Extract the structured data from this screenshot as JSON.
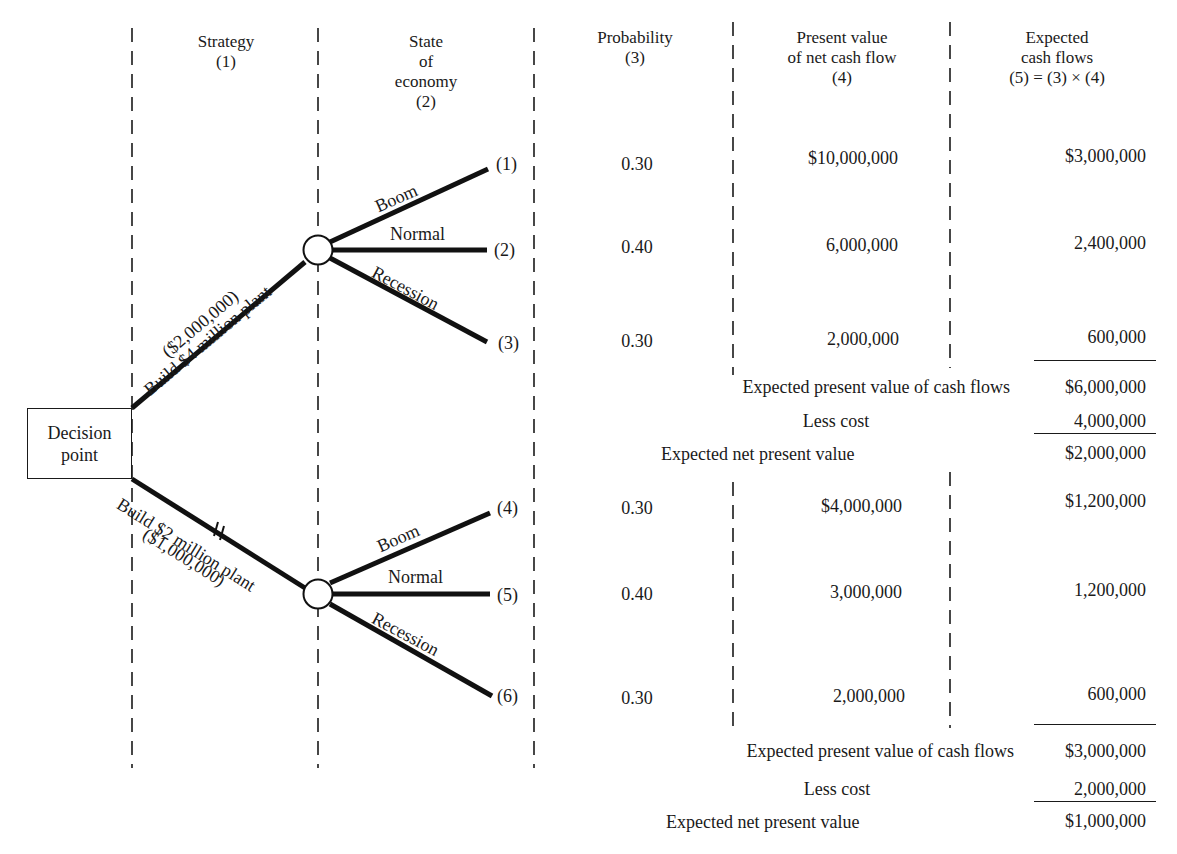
{
  "headers": {
    "strategy": [
      "Strategy",
      "(1)"
    ],
    "state_of_economy": [
      "State",
      "of",
      "economy",
      "(2)"
    ],
    "probability": [
      "Probability",
      "(3)"
    ],
    "present_value": [
      "Present value",
      "of net cash flow",
      "(4)"
    ],
    "expected_cash_flows": [
      "Expected",
      "cash flows",
      "(5) = (3) × (4)"
    ]
  },
  "decision_point": [
    "Decision",
    "point"
  ],
  "strategies": [
    {
      "label": "Build $4 million plant",
      "sub_label": "($2,000,000)",
      "outcomes": [
        {
          "state": "Boom",
          "node": "(1)",
          "probability": "0.30",
          "present_value": "$10,000,000",
          "expected": "$3,000,000"
        },
        {
          "state": "Normal",
          "node": "(2)",
          "probability": "0.40",
          "present_value": "6,000,000",
          "expected": "2,400,000"
        },
        {
          "state": "Recession",
          "node": "(3)",
          "probability": "0.30",
          "present_value": "2,000,000",
          "expected": "600,000"
        }
      ],
      "summary": {
        "expected_pv_label": "Expected present value of cash flows",
        "expected_pv_value": "$6,000,000",
        "less_cost_label": "Less cost",
        "less_cost_value": "4,000,000",
        "enpv_label": "Expected net present value",
        "enpv_value": "$2,000,000"
      }
    },
    {
      "label": "Build $2 million plant",
      "sub_label": "($1,000,000)",
      "rejected_mark": "//",
      "outcomes": [
        {
          "state": "Boom",
          "node": "(4)",
          "probability": "0.30",
          "present_value": "$4,000,000",
          "expected": "$1,200,000"
        },
        {
          "state": "Normal",
          "node": "(5)",
          "probability": "0.40",
          "present_value": "3,000,000",
          "expected": "1,200,000"
        },
        {
          "state": "Recession",
          "node": "(6)",
          "probability": "0.30",
          "present_value": "2,000,000",
          "expected": "600,000"
        }
      ],
      "summary": {
        "expected_pv_label": "Expected present value of cash flows",
        "expected_pv_value": "$3,000,000",
        "less_cost_label": "Less cost",
        "less_cost_value": "2,000,000",
        "enpv_label": "Expected net present value",
        "enpv_value": "$1,000,000"
      }
    }
  ]
}
